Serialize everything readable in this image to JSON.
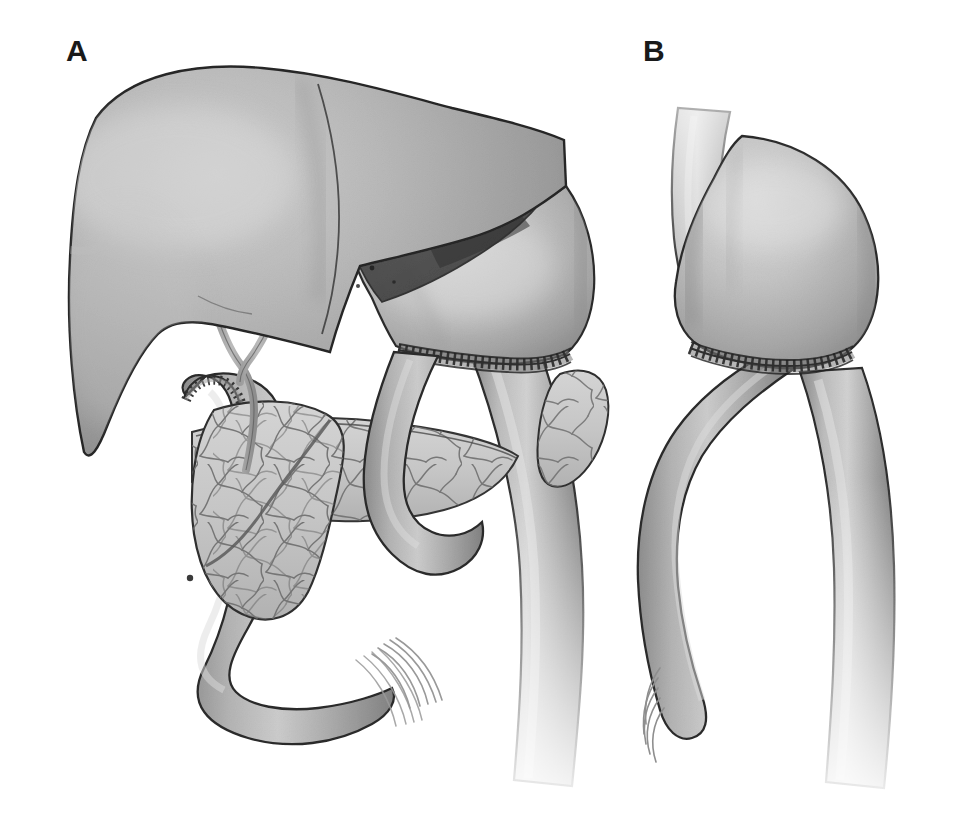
{
  "figure": {
    "kind": "medical-illustration",
    "title_visible": false,
    "background_color": "#ffffff",
    "width": 957,
    "height": 823,
    "panels": [
      {
        "id": "panel-a",
        "label": "A",
        "label_position": {
          "x": 66,
          "y": 36
        },
        "description_visible": false,
        "structures": [
          "liver",
          "liver-left-lateral-segment-translucent",
          "gastric-pouch",
          "gastrojejunal-anastomosis-suture-line",
          "hepatic-duct-y-confluence",
          "roux-limb",
          "jejunal-stump-suture-line",
          "mesentery-left-fan",
          "mesentery-right-fan",
          "mesenteric-band",
          "efferent-limb-descending"
        ]
      },
      {
        "id": "panel-b",
        "label": "B",
        "label_position": {
          "x": 643,
          "y": 36
        },
        "description_visible": false,
        "structures": [
          "esophagus",
          "gastric-pouch",
          "gastrojejunal-anastomosis-suture-line",
          "roux-limb-loop",
          "efferent-limb-descending"
        ]
      }
    ]
  },
  "palette": {
    "background": "#ffffff",
    "outline": "#2b2b2b",
    "organ_light": "#d2d2d2",
    "organ_mid": "#a8a8a8",
    "organ_dark": "#8a8a8a",
    "organ_shadow": "#6e6e6e",
    "translucent_lobe": "#4a4a4a",
    "mesentery_fill": "#c6c6c6",
    "vessel_line": "#5a5a5a",
    "suture_thread": "#303030",
    "label_text": "#1a1a1a"
  },
  "annotations": {
    "none_visible": true
  }
}
